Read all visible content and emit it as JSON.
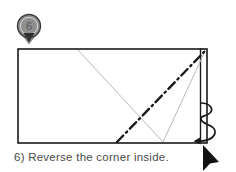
{
  "step": {
    "number": "6",
    "caption": "6) Reverse the corner inside.",
    "marker_icon": "map-pin-icon"
  },
  "diagram": {
    "shape": "rectangle",
    "paper": {
      "x": 18,
      "y": 49,
      "width": 189,
      "height": 94,
      "fill": "#ffffff",
      "stroke": "#1a1a1a"
    },
    "flap": {
      "name": "right-edge-flap",
      "fill": "#8c8c8c",
      "x": 201,
      "y": 48,
      "width": 6,
      "height": 53
    },
    "crease_lines": [
      {
        "name": "existing-crease-left-diagonal",
        "style": "thin-gray",
        "color": "#b9b9b9",
        "from": [
          78,
          50
        ],
        "to": [
          163,
          142
        ]
      },
      {
        "name": "existing-crease-right-diagonal",
        "style": "thin-gray",
        "color": "#b9b9b9",
        "from": [
          163,
          142
        ],
        "to": [
          205,
          51
        ]
      }
    ],
    "fold_line": {
      "name": "valley-fold-dash-dot",
      "style": "dash-dot",
      "color": "#1a1a1a",
      "from": [
        117,
        142
      ],
      "to": [
        205,
        51
      ]
    },
    "arrow": {
      "name": "reverse-fold-curved-arrow",
      "color": "#1a1a1a",
      "type": "curved-loop"
    }
  },
  "cursor": {
    "name": "mouse-pointer",
    "x": 205,
    "y": 147,
    "color": "#111111"
  },
  "colors": {
    "ink": "#1a1a1a",
    "gray_line": "#b9b9b9",
    "flap_gray": "#8c8c8c",
    "pin_gray": "#8f8f8f",
    "caption_text": "#4a4a4a"
  }
}
